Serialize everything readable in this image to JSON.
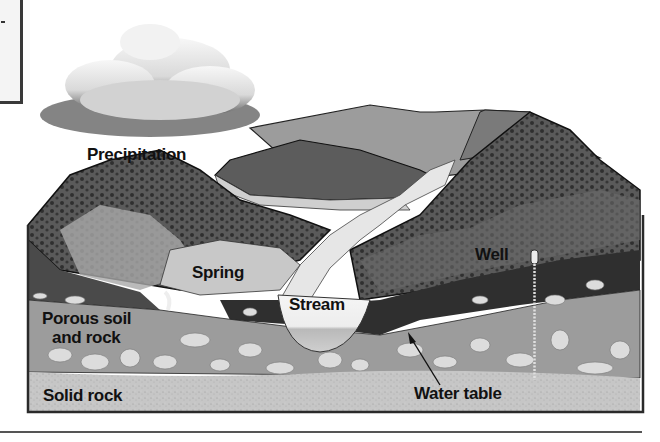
{
  "diagram": {
    "type": "groundwater cross-section",
    "labels": {
      "precipitation": "Precipitation",
      "spring": "Spring",
      "stream": "Stream",
      "well": "Well",
      "porous_soil": "Porous soil and rock",
      "porous_soil_line1": "Porous soil",
      "porous_soil_line2": "and rock",
      "solid_rock": "Solid rock",
      "water_table": "Water table"
    },
    "colors": {
      "frame": "#2a2a2a",
      "hills_dark": "#3e3e3e",
      "hills_mid": "#8a8a8a",
      "stream": "#e8e8e8",
      "porous_layer": "#9a9a9a",
      "pebbles": "#d8d8d8",
      "solid_rock": "#c4c4c4",
      "saturated_dark": "#2e2e2e"
    }
  }
}
